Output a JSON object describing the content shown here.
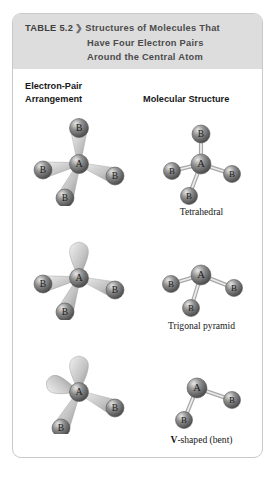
{
  "table": {
    "number_label": "TABLE 5.2",
    "chevron": "❯",
    "title_line1": "Structures of Molecules That",
    "title_line2": "Have Four Electron Pairs",
    "title_line3": "Around the Central Atom",
    "band_color": "#dddddd",
    "border_color": "#c9c9c9"
  },
  "columns": {
    "left_line1": "Electron-Pair",
    "left_line2": "Arrangement",
    "right": "Molecular Structure"
  },
  "atoms": {
    "central_label": "A",
    "terminal_label": "B",
    "sphere_color": "#8f8f8f",
    "sphere_highlight": "#e8e8e8",
    "bond_color": "#cfcfcf"
  },
  "rows": [
    {
      "name": "tetrahedral",
      "electron_pair_arrangement": {
        "type": "electron-pair",
        "bonding_pairs": 4,
        "lone_pairs": 0,
        "atoms": [
          {
            "label": "A",
            "x": 62,
            "y": 50,
            "r": 9.5,
            "kind": "central"
          },
          {
            "label": "B",
            "x": 62,
            "y": 14,
            "r": 9.5,
            "kind": "terminal"
          },
          {
            "label": "B",
            "x": 26,
            "y": 56,
            "r": 9.0,
            "kind": "terminal"
          },
          {
            "label": "B",
            "x": 98,
            "y": 62,
            "r": 9.0,
            "kind": "terminal"
          },
          {
            "label": "B",
            "x": 48,
            "y": 84,
            "r": 9.0,
            "kind": "terminal"
          }
        ]
      },
      "molecular_structure": {
        "type": "ball-and-stick",
        "caption": "Tetrahedral",
        "caption_bold_prefix": "",
        "atoms": [
          {
            "label": "A",
            "x": 62,
            "y": 50,
            "r": 10.0,
            "kind": "central"
          },
          {
            "label": "B",
            "x": 62,
            "y": 20,
            "r": 9.0,
            "kind": "terminal"
          },
          {
            "label": "B",
            "x": 33,
            "y": 57,
            "r": 8.5,
            "kind": "terminal"
          },
          {
            "label": "B",
            "x": 93,
            "y": 60,
            "r": 8.5,
            "kind": "terminal"
          },
          {
            "label": "B",
            "x": 50,
            "y": 82,
            "r": 8.5,
            "kind": "terminal"
          }
        ]
      }
    },
    {
      "name": "trigonal-pyramid",
      "electron_pair_arrangement": {
        "type": "electron-pair",
        "bonding_pairs": 3,
        "lone_pairs": 1,
        "atoms": [
          {
            "label": "A",
            "x": 62,
            "y": 50,
            "r": 9.5,
            "kind": "central"
          },
          {
            "label": "B",
            "x": 26,
            "y": 56,
            "r": 9.0,
            "kind": "terminal"
          },
          {
            "label": "B",
            "x": 98,
            "y": 62,
            "r": 9.0,
            "kind": "terminal"
          },
          {
            "label": "B",
            "x": 48,
            "y": 84,
            "r": 9.0,
            "kind": "terminal"
          }
        ]
      },
      "molecular_structure": {
        "type": "ball-and-stick",
        "caption": "Trigonal pyramid",
        "caption_bold_prefix": "",
        "atoms": [
          {
            "label": "A",
            "x": 62,
            "y": 47,
            "r": 10.0,
            "kind": "central"
          },
          {
            "label": "B",
            "x": 32,
            "y": 56,
            "r": 8.5,
            "kind": "terminal"
          },
          {
            "label": "B",
            "x": 95,
            "y": 60,
            "r": 8.5,
            "kind": "terminal"
          },
          {
            "label": "B",
            "x": 52,
            "y": 80,
            "r": 8.5,
            "kind": "terminal"
          }
        ]
      }
    },
    {
      "name": "v-shaped-bent",
      "electron_pair_arrangement": {
        "type": "electron-pair",
        "bonding_pairs": 2,
        "lone_pairs": 2,
        "atoms": [
          {
            "label": "A",
            "x": 62,
            "y": 50,
            "r": 9.5,
            "kind": "central"
          },
          {
            "label": "B",
            "x": 98,
            "y": 66,
            "r": 9.0,
            "kind": "terminal"
          },
          {
            "label": "B",
            "x": 44,
            "y": 86,
            "r": 9.0,
            "kind": "terminal"
          }
        ]
      },
      "molecular_structure": {
        "type": "ball-and-stick",
        "caption": "-shaped (bent)",
        "caption_bold_prefix": "V",
        "atoms": [
          {
            "label": "A",
            "x": 58,
            "y": 46,
            "r": 10.0,
            "kind": "central"
          },
          {
            "label": "B",
            "x": 93,
            "y": 58,
            "r": 8.5,
            "kind": "terminal"
          },
          {
            "label": "B",
            "x": 45,
            "y": 78,
            "r": 8.5,
            "kind": "terminal"
          }
        ]
      }
    }
  ]
}
